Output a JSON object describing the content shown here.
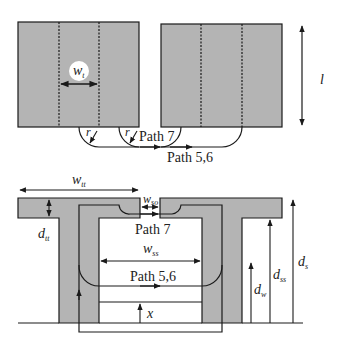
{
  "colors": {
    "core": "#b4b4b4",
    "stroke": "#1a1a1a",
    "background": "#ffffff",
    "label_bubble": "#ffffff"
  },
  "top_view": {
    "tooth_width_label": {
      "base": "w",
      "sub": "t"
    },
    "length_label": "l",
    "radius_labels": [
      "r",
      "r"
    ],
    "path_7_label": "Path 7",
    "path_56_label": "Path 5,6"
  },
  "cross_section": {
    "tooth_tip_width_label": {
      "base": "w",
      "sub": "tt"
    },
    "slot_opening_label": {
      "base": "w",
      "sub": "so"
    },
    "tooth_tip_depth_label": {
      "base": "d",
      "sub": "tt"
    },
    "slot_width_label": {
      "base": "w",
      "sub": "ss"
    },
    "path_7_label": "Path 7",
    "path_56_label": "Path 5,6",
    "position_label": "x",
    "winding_depth_label": {
      "base": "d",
      "sub": "w"
    },
    "slot_side_depth_label": {
      "base": "d",
      "sub": "ss"
    },
    "slot_depth_label": {
      "base": "d",
      "sub": "s"
    }
  }
}
